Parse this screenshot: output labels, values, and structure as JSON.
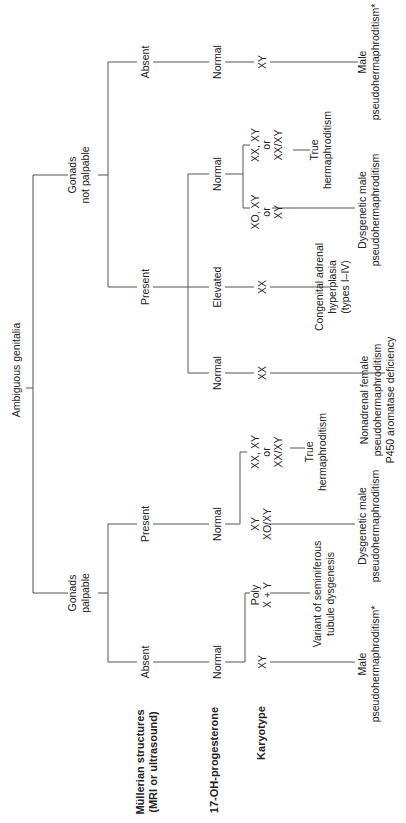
{
  "diagram": {
    "orientation": "rotated-90-ccw",
    "root": "Ambiguous genitalia",
    "row_headers": {
      "mullerian": [
        "Müllerian structures",
        "(MRI or ultrasound)"
      ],
      "ohp": "17-OH-progesterone",
      "karyotype": "Karyotype"
    },
    "branches": {
      "not_palpable": {
        "label": [
          "Gonads",
          "not palpable"
        ],
        "absent": {
          "mullerian": "Absent",
          "ohp": "Normal",
          "karyotype": "XY",
          "diagnosis": [
            "Male",
            "pseudohermaphroditism*"
          ]
        },
        "present": {
          "mullerian": "Present",
          "normal": {
            "ohp": "Normal",
            "k1": [
              "XO, XY",
              "or",
              "XY"
            ],
            "d1": [
              "Dysgenetic male",
              "pseudohermaphroditism"
            ],
            "k2": [
              "XX, XY",
              "or",
              "XX/XY"
            ],
            "d2": [
              "True",
              "hermaphroditism"
            ]
          },
          "elevated": {
            "ohp": "Elevated",
            "karyotype": "XX",
            "diagnosis": [
              "Congenital adrenal",
              "hyperplasia",
              "(types I–IV)"
            ]
          },
          "normal2": {
            "ohp": "Normal",
            "karyotype": "XX",
            "diagnosis": [
              "Nonadrenal female",
              "pseudohermaphroditism",
              "P450 aromatase deficiency"
            ]
          }
        }
      },
      "palpable": {
        "label": [
          "Gonads",
          "palpable"
        ],
        "present": {
          "mullerian": "Present",
          "ohp": "Normal",
          "k1": [
            "XX, XY",
            "or",
            "XX/XY"
          ],
          "d1": [
            "True",
            "hermaphroditism"
          ],
          "k2": [
            "XY",
            "XO/XY"
          ],
          "d2": [
            "Dysgenetic male",
            "pseudohermaphroditism"
          ]
        },
        "absent": {
          "mullerian": "Absent",
          "ohp": "Normal",
          "k1": [
            "Poly",
            "X + Y"
          ],
          "d1": [
            "Variant of seminiferous",
            "tubule dysgenesis"
          ],
          "k2": "XY",
          "d2": [
            "Male",
            "pseudohermaphroditism*"
          ]
        }
      }
    }
  }
}
